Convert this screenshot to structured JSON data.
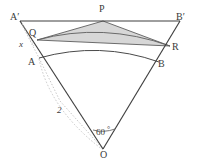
{
  "figure": {
    "colors": {
      "stroke": "#3f3f3f",
      "shade_fill": "#d9d9d9",
      "shade_stroke": "#6e6e6e",
      "dotted": "#b0b0b0",
      "arc": "#565656",
      "background": "#ffffff",
      "text": "#3a3a3a"
    },
    "points": {
      "O": {
        "label": "O",
        "x": 105,
        "y": 150
      },
      "A": {
        "label": "A",
        "x": 39,
        "y": 58
      },
      "B": {
        "label": "B",
        "x": 159,
        "y": 63
      },
      "A2": {
        "label": "A′",
        "x": 20,
        "y": 20
      },
      "B2": {
        "label": "B′",
        "x": 180,
        "y": 20
      },
      "P": {
        "label": "P",
        "x": 103,
        "y": 20
      },
      "Q": {
        "label": "Q",
        "x": 37,
        "y": 38
      },
      "R": {
        "label": "R",
        "x": 170,
        "y": 47
      }
    },
    "labels": [
      {
        "name": "label-A-prime",
        "text": "A′",
        "x": 10,
        "y": 12,
        "style": "plain"
      },
      {
        "name": "label-P",
        "text": "P",
        "x": 99,
        "y": 5,
        "style": "plain"
      },
      {
        "name": "label-B-prime",
        "text": "B′",
        "x": 176,
        "y": 12,
        "style": "plain"
      },
      {
        "name": "label-Q",
        "text": "Q",
        "x": 30,
        "y": 29,
        "style": "plain"
      },
      {
        "name": "label-R",
        "text": "R",
        "x": 172,
        "y": 42,
        "style": "plain"
      },
      {
        "name": "label-A",
        "text": "A",
        "x": 29,
        "y": 58,
        "style": "plain"
      },
      {
        "name": "label-B",
        "text": "B",
        "x": 159,
        "y": 60,
        "style": "plain"
      },
      {
        "name": "label-O",
        "text": "O",
        "x": 101,
        "y": 150,
        "style": "plain"
      },
      {
        "name": "label-x",
        "text": "x",
        "x": 19,
        "y": 41,
        "style": "italic"
      },
      {
        "name": "label-radius",
        "text": "2",
        "x": 58,
        "y": 107,
        "style": "italic"
      },
      {
        "name": "label-angle",
        "text": "60",
        "x": 96,
        "y": 130,
        "style": "plain"
      },
      {
        "name": "label-degree",
        "text": "°",
        "x": 108,
        "y": 128,
        "style": "small"
      }
    ],
    "measurements": {
      "radius_value": "2",
      "angle_value": "60",
      "angle_unit": "°",
      "unknown_segment": "x"
    },
    "geometry_notes": {
      "sector_vertex": "O",
      "sector_angle_degrees": 60,
      "inner_arc_endpoints": [
        "A",
        "B"
      ],
      "outer_arc_endpoints": [
        "Q",
        "R"
      ],
      "outer_triangle_vertices": [
        "A′",
        "P",
        "B′"
      ],
      "shaded_region_vertices": [
        "P",
        "Q",
        "R"
      ]
    }
  }
}
